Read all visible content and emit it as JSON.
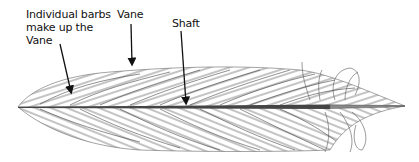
{
  "diagram": {
    "colors": {
      "background": "#ffffff",
      "ink": "#111111",
      "barb_shading": "#555555",
      "shaft": "#444444"
    },
    "labels": [
      {
        "id": "barbs",
        "text": "Individual barbs\nmake up the\nVane",
        "points_to": "vane-barbs"
      },
      {
        "id": "vane",
        "text": "Vane",
        "points_to": "vane-edge"
      },
      {
        "id": "shaft",
        "text": "Shaft",
        "points_to": "shaft"
      }
    ]
  }
}
